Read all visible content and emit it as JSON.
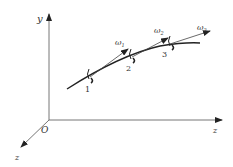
{
  "diagram": {
    "axes": {
      "vertical_label": "y",
      "horizontal_label": "z",
      "diagonal_label": "z",
      "origin_label": "O"
    },
    "points": [
      {
        "label": "1",
        "omega": "ω",
        "omega_sub": "1"
      },
      {
        "label": "2",
        "omega": "ω",
        "omega_sub": "2"
      },
      {
        "label": "3",
        "omega": "ω",
        "omega_sub": "3"
      }
    ],
    "colors": {
      "line": "#333333",
      "axis": "#555555"
    }
  }
}
